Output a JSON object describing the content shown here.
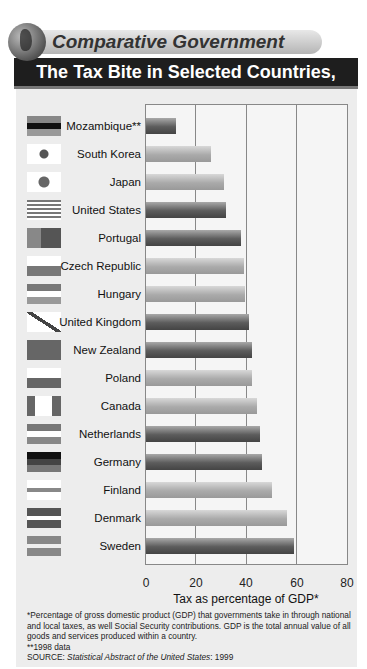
{
  "header": {
    "kicker": "Comparative Government",
    "title": "The Tax Bite in Selected Countries, 1999"
  },
  "chart_data": {
    "type": "bar",
    "orientation": "horizontal",
    "title": "The Tax Bite in Selected Countries, 1999",
    "xlabel": "Tax as percentage of GDP*",
    "ylabel": "",
    "xlim": [
      0,
      80
    ],
    "xticks": [
      "0",
      "20",
      "40",
      "60",
      "80"
    ],
    "grid": true,
    "categories": [
      "Mozambique**",
      "South Korea",
      "Japan",
      "United States",
      "Portugal",
      "Czech Republic",
      "Hungary",
      "United Kingdom",
      "New Zealand",
      "Poland",
      "Canada",
      "Netherlands",
      "Germany",
      "Finland",
      "Denmark",
      "Sweden"
    ],
    "values": [
      12,
      26,
      31,
      32,
      38,
      39,
      39.5,
      41,
      42,
      42,
      44,
      45.5,
      46,
      50,
      56,
      59
    ],
    "bar_shades": [
      "dark",
      "light",
      "light",
      "dark",
      "dark",
      "light",
      "light",
      "dark",
      "dark",
      "light",
      "light",
      "dark",
      "dark",
      "light",
      "light",
      "dark"
    ]
  },
  "flags": [
    "mozambique-flag",
    "south-korea-flag",
    "japan-flag",
    "united-states-flag",
    "portugal-flag",
    "czech-republic-flag",
    "hungary-flag",
    "united-kingdom-flag",
    "new-zealand-flag",
    "poland-flag",
    "canada-flag",
    "netherlands-flag",
    "germany-flag",
    "finland-flag",
    "denmark-flag",
    "sweden-flag"
  ],
  "footnotes": {
    "note1": "*Percentage of gross domestic product (GDP) that governments take in through national and local taxes, as well Social Security contributions. GDP is the total annual value of all goods and services produced within a country.",
    "note2": "**1998 data",
    "source_prefix": "SOURCE: ",
    "source_title": "Statistical Abstract of the United States",
    "source_suffix": ": 1999"
  }
}
